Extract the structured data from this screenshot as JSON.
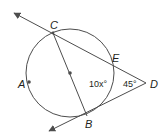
{
  "diagram": {
    "type": "circle-geometry",
    "colors": {
      "stroke": "#4d4d4d",
      "text": "#231f20",
      "background": "#ffffff"
    },
    "circle": {
      "cx": 70,
      "cy": 73,
      "r": 44
    },
    "points": {
      "A": {
        "label": "A",
        "x": 29,
        "y": 82
      },
      "B": {
        "label": "B",
        "x": 87,
        "y": 116
      },
      "C": {
        "label": "C",
        "x": 53,
        "y": 33
      },
      "D": {
        "label": "D",
        "x": 146,
        "y": 83
      },
      "E": {
        "label": "E",
        "x": 111,
        "y": 63
      },
      "center": {
        "x": 70,
        "y": 73
      }
    },
    "angles": {
      "arc_label": "10x°",
      "angle_D": "45°"
    },
    "segments": [
      {
        "name": "secant-DC",
        "from": "D",
        "to": "C",
        "extends_with_arrow": true
      },
      {
        "name": "tangent-DB",
        "from": "D",
        "to": "B",
        "extends_with_arrow": true
      },
      {
        "name": "diameter-CB",
        "from": "C",
        "to": "B"
      }
    ]
  }
}
